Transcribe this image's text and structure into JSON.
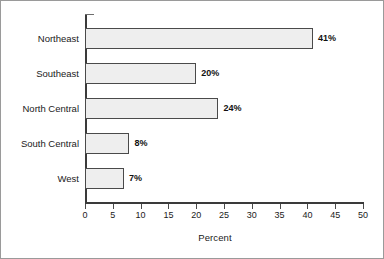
{
  "chart_data": {
    "type": "bar",
    "orientation": "horizontal",
    "title": "",
    "subtitle": "",
    "xlabel": "Percent",
    "ylabel": "",
    "categories": [
      "Northeast",
      "Southeast",
      "North Central",
      "South Central",
      "West"
    ],
    "values": [
      41,
      20,
      24,
      8,
      7
    ],
    "value_labels": [
      "41%",
      "20%",
      "24%",
      "8%",
      "7%"
    ],
    "xlim": [
      0,
      50
    ],
    "xticks": [
      0,
      5,
      10,
      15,
      20,
      25,
      30,
      35,
      40,
      45,
      50
    ],
    "xtick_labels": [
      "0",
      "5",
      "10",
      "15",
      "20",
      "25",
      "30",
      "35",
      "40",
      "45",
      "50"
    ],
    "grid": false,
    "legend": null,
    "legend_position": "none",
    "annotations": [],
    "colors": {
      "bar_fill": "#eeeeee",
      "bar_border": "#4a4a4a",
      "axis": "#3a3a3a",
      "text": "#1a1a1a",
      "frame": "#9a9a9a",
      "background": "#ffffff"
    }
  }
}
